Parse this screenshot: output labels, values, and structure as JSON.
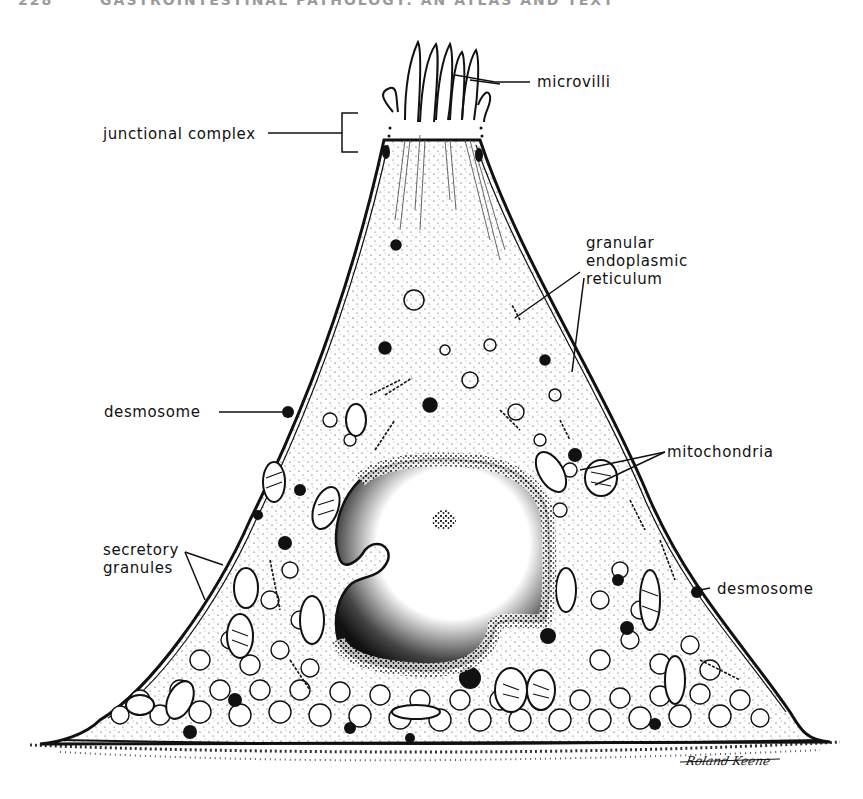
{
  "page_header": {
    "page_number": "228",
    "running_title": "GASTROINTESTINAL PATHOLOGY: AN ATLAS AND TEXT"
  },
  "figure": {
    "labels": {
      "microvilli": "microvilli",
      "junctional_complex": "junctional complex",
      "granular_er_line1": "granular",
      "granular_er_line2": "endoplasmic",
      "granular_er_line3": "reticulum",
      "desmosome_left": "desmosome",
      "mitochondria": "mitochondria",
      "secretory_granules_line1": "secretory",
      "secretory_granules_line2": "granules",
      "desmosome_right": "desmosome"
    },
    "artist_signature": "Roland Keene",
    "colors": {
      "ink": "#111111",
      "paper": "#ffffff",
      "header_gray": "#9a9a9a"
    }
  }
}
